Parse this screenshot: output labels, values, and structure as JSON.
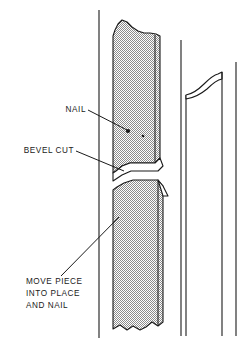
{
  "figure": {
    "type": "technical-line-illustration",
    "background_color": "#ffffff",
    "ink_color": "#1a1a1a",
    "hatch_color": "#8c8c8c"
  },
  "callouts": [
    {
      "id": "nail",
      "label": "NAIL",
      "lines": [
        "NAIL"
      ],
      "text_anchor": {
        "x": 86,
        "y": 112
      },
      "leader": {
        "x1": 88,
        "y1": 110,
        "x2": 127,
        "y2": 130
      }
    },
    {
      "id": "bevel-cut",
      "label": "BEVEL CUT",
      "lines": [
        "BEVEL CUT"
      ],
      "text_anchor": {
        "x": 73,
        "y": 153
      },
      "leader": {
        "x1": 76,
        "y1": 151,
        "x2": 124,
        "y2": 171
      }
    },
    {
      "id": "move-piece",
      "label": "MOVE PIECE INTO PLACE AND NAIL",
      "lines": [
        "MOVE PIECE",
        "INTO PLACE",
        "AND NAIL"
      ],
      "text_anchor": {
        "x": 26,
        "y": 284
      },
      "leader": {
        "x1": 61,
        "y1": 276,
        "x2": 119,
        "y2": 217
      }
    }
  ],
  "nails": [
    {
      "id": "nail-head-large",
      "cx": 128,
      "cy": 131,
      "r": 2.1
    },
    {
      "id": "nail-head-small",
      "cx": 143,
      "cy": 136,
      "r": 1.3
    }
  ],
  "geometry": {
    "wall_line": {
      "x": 99,
      "y1": 10,
      "y2": 338
    },
    "upper_board": {
      "top_break": "ragged",
      "left_x": 112,
      "right_x": 160,
      "top_y": 19,
      "bevel_bottom_y": 170
    },
    "lower_board": {
      "bottom_break": "ragged",
      "left_x": 112,
      "right_x": 163,
      "top_y": 180,
      "bottom_y": 330
    },
    "right_board": {
      "left_x": 181,
      "right_x": 206,
      "top_y": 72,
      "bottom_y": 336,
      "end_cut": "curved-scoop"
    },
    "far_right_line": {
      "x": 228,
      "y1": 62,
      "y2": 336
    }
  }
}
